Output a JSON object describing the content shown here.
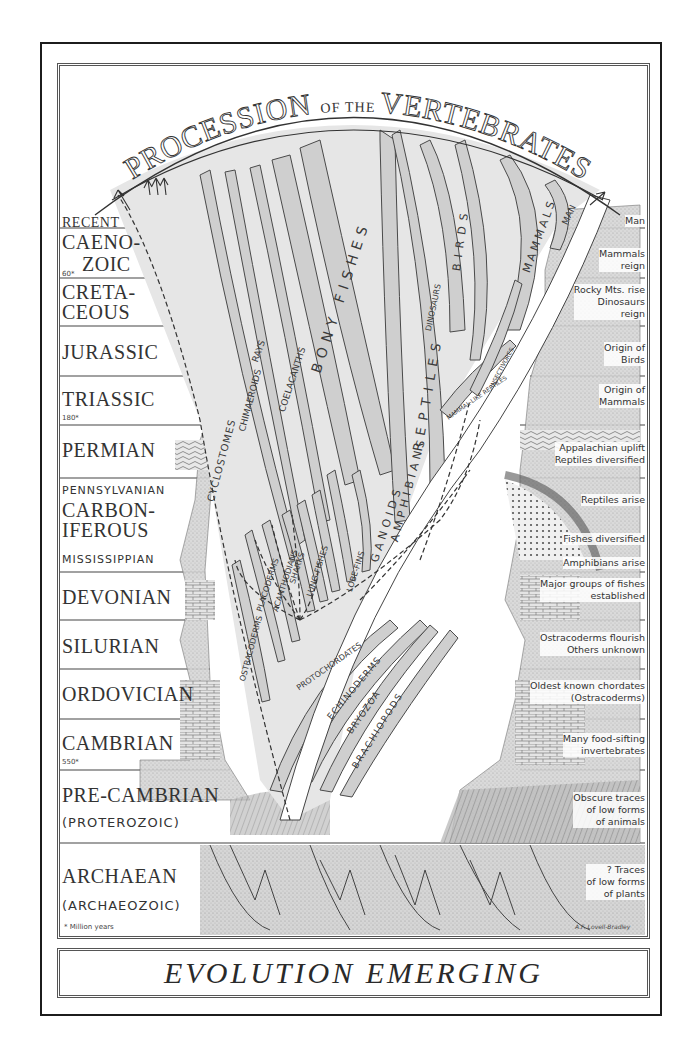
{
  "title": {
    "top_arc": "PROCESSION OF THE VERTEBRATES",
    "top_arc_parts": [
      "PROCESSION",
      "OF THE",
      "VERTEBRATES"
    ],
    "bottom": "EVOLUTION EMERGING"
  },
  "eras": [
    {
      "name": "RECENT",
      "size": "big"
    },
    {
      "name": "CAENO-",
      "size": "big"
    },
    {
      "name": "ZOIC",
      "size": "big",
      "myr": "60"
    },
    {
      "name": "CRETA-",
      "size": "big"
    },
    {
      "name": "CEOUS",
      "size": "big"
    },
    {
      "name": "JURASSIC",
      "size": "big"
    },
    {
      "name": "TRIASSIC",
      "size": "big",
      "myr": "180"
    },
    {
      "name": "PERMIAN",
      "size": "big"
    },
    {
      "name": "PENNSYLVANIAN",
      "size": "small"
    },
    {
      "name": "CARBON-",
      "size": "big"
    },
    {
      "name": "IFEROUS",
      "size": "big"
    },
    {
      "name": "MISSISSIPPIAN",
      "size": "small"
    },
    {
      "name": "DEVONIAN",
      "size": "big"
    },
    {
      "name": "SILURIAN",
      "size": "big"
    },
    {
      "name": "ORDOVICIAN",
      "size": "big"
    },
    {
      "name": "CAMBRIAN",
      "size": "big",
      "myr": "550"
    },
    {
      "name": "PRE-CAMBRIAN",
      "size": "big"
    },
    {
      "name": "(PROTEROZOIC)",
      "size": "small"
    },
    {
      "name": "ARCHAEAN",
      "size": "big"
    },
    {
      "name": "(ARCHAEOZOIC)",
      "size": "small"
    }
  ],
  "myr_labels": {
    "caenozoic": "60*",
    "triassic": "180*",
    "cambrian": "550*"
  },
  "events": [
    {
      "period": "Recent",
      "text": [
        "Man"
      ]
    },
    {
      "period": "Caenozoic",
      "text": [
        "Mammals",
        "reign"
      ]
    },
    {
      "period": "Cretaceous",
      "text": [
        "Rocky Mts. rise",
        "Dinosaurs",
        "reign"
      ]
    },
    {
      "period": "Jurassic",
      "text": [
        "Origin of",
        "Birds"
      ]
    },
    {
      "period": "Triassic",
      "text": [
        "Origin of",
        "Mammals"
      ]
    },
    {
      "period": "Permian",
      "text": [
        "Appalachian uplift",
        "Reptiles diversified"
      ]
    },
    {
      "period": "Pennsylvanian",
      "text": [
        "Reptiles arise"
      ]
    },
    {
      "period": "Mississippian",
      "text": [
        "Fishes diversified",
        "Amphibians arise"
      ]
    },
    {
      "period": "Devonian",
      "text": [
        "Major groups of fishes",
        "established"
      ]
    },
    {
      "period": "Silurian",
      "text": [
        "Ostracoderms flourish",
        "Others unknown"
      ]
    },
    {
      "period": "Ordovician",
      "text": [
        "Oldest known chordates",
        "(Ostracoderms)"
      ]
    },
    {
      "period": "Cambrian",
      "text": [
        "Many food-sifting",
        "invertebrates"
      ]
    },
    {
      "period": "Pre-Cambrian",
      "text": [
        "Obscure traces",
        "of low forms",
        "of animals"
      ]
    },
    {
      "period": "Archaean",
      "text": [
        "? Traces",
        "of low forms",
        "of plants"
      ]
    }
  ],
  "lineages": [
    "CYCLOSTOMES",
    "CHIMAEROIDS",
    "RAYS",
    "COELACANTHS",
    "BONY FISHES",
    "OSTRACODERMS",
    "PLACODERMS",
    "ACANTHODIANS",
    "SHARKS",
    "SHARKS-FISHES",
    "LUNG-FISHES",
    "LOBE-FINS",
    "GANOIDS",
    "AMPHIBIANS",
    "REPTILES",
    "DINOSAURS",
    "BIRDS",
    "MAMMALS",
    "MAN",
    "MAMMAL-LIKE REPTILES",
    "PROTOCHORDATES",
    "ECHINODERMS",
    "BRYOZOA",
    "BRACHIOPODS",
    "INSECTIVORES"
  ],
  "footer": {
    "legend": "* Million years",
    "credit": "A.F. Lovell-Bradley"
  },
  "colors": {
    "ink": "#2a2a2a",
    "shade": "#c9c9c9",
    "shade_dark": "#8d8d8d",
    "paper": "#ffffff"
  }
}
